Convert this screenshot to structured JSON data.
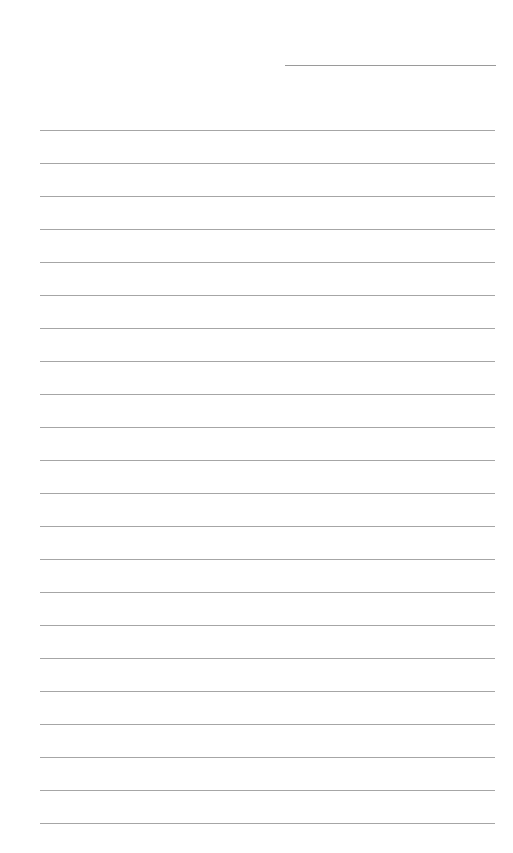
{
  "document": {
    "type": "lined-paper",
    "header_field": {
      "label": "",
      "value": ""
    },
    "lines": {
      "count": 22,
      "first_y": 130,
      "spacing": 33,
      "contents": [
        "",
        "",
        "",
        "",
        "",
        "",
        "",
        "",
        "",
        "",
        "",
        "",
        "",
        "",
        "",
        "",
        "",
        "",
        "",
        "",
        "",
        ""
      ]
    },
    "colors": {
      "background": "#ffffff",
      "rule": "#a6a6a6",
      "header_rule": "#9a9a9a"
    }
  }
}
